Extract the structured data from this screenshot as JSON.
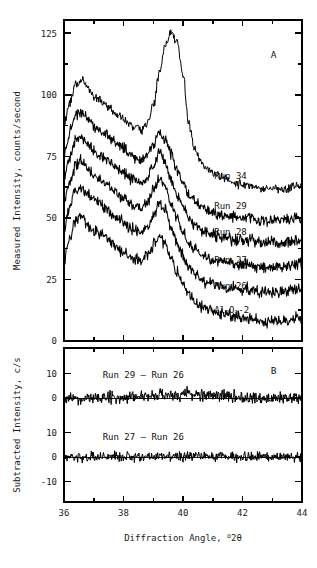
{
  "figure": {
    "xlabel_main": "Diffraction Angle, ",
    "xlabel_sup": "o",
    "xlabel_tail": "2θ",
    "panel_a_label": "A",
    "panel_b_label": "B",
    "ylabel_a": "Measured Intensity, counts/second",
    "ylabel_b": "Subtracted Intensity, c/s"
  },
  "chart_data": {
    "type": "line",
    "title": "",
    "xlabel": "Diffraction Angle, °2θ",
    "panels": [
      {
        "id": "A",
        "label": "A",
        "ylabel": "Measured Intensity, counts/second",
        "xlim": [
          36,
          44
        ],
        "ylim": [
          0,
          133
        ],
        "xticks": [
          36,
          38,
          40,
          42,
          44
        ],
        "xticklabels": [
          "36",
          "38",
          "40",
          "42",
          "44"
        ],
        "xminor": [
          37,
          39,
          41,
          43
        ],
        "yticks": [
          0,
          25,
          50,
          75,
          100,
          125
        ],
        "yticklabels": [
          "0",
          "25",
          "50",
          "75",
          "100",
          "125"
        ],
        "yminor": [
          12.5,
          37.5,
          62.5,
          87.5,
          112.5
        ],
        "grid": false,
        "legend_position": "inline-right",
        "series": [
          {
            "name": "Run 34",
            "label": "Run 34",
            "label_x": 41.05,
            "label_y": 66,
            "offset": 57,
            "noise": 1.5,
            "main_peak_height": 68,
            "shoulder_height": 49,
            "mid_peak_height": 0,
            "x": [
              36.0,
              36.2,
              36.4,
              36.6,
              36.8,
              37.0,
              37.2,
              37.4,
              37.6,
              37.8,
              38.0,
              38.2,
              38.4,
              38.6,
              38.8,
              39.0,
              39.2,
              39.4,
              39.6,
              39.8,
              40.0,
              40.2,
              40.4,
              40.6,
              40.8,
              41.0,
              41.4,
              41.8,
              42.2,
              42.6,
              43.0,
              43.4,
              43.8,
              44.0
            ],
            "y": [
              88,
              97,
              104,
              106,
              103,
              99,
              98,
              96,
              94,
              92,
              90,
              88,
              87,
              86,
              88,
              95,
              108,
              120,
              125,
              122,
              108,
              88,
              78,
              73,
              70,
              68,
              66,
              64,
              63,
              62,
              62,
              62,
              63,
              63
            ]
          },
          {
            "name": "Run 29",
            "label": "Run 29",
            "label_x": 41.05,
            "label_y": 53.5,
            "offset": 44,
            "noise": 2.0,
            "main_peak_height": 0,
            "shoulder_height": 0,
            "mid_peak_height": 0,
            "x": [
              36.0,
              36.2,
              36.4,
              36.6,
              36.8,
              37.0,
              37.2,
              37.4,
              37.6,
              37.8,
              38.0,
              38.2,
              38.4,
              38.6,
              38.8,
              39.0,
              39.2,
              39.4,
              39.6,
              39.8,
              40.0,
              40.2,
              40.4,
              40.6,
              40.8,
              41.0,
              41.4,
              41.8,
              42.2,
              42.6,
              43.0,
              43.4,
              43.8,
              44.0
            ],
            "y": [
              76,
              85,
              92,
              93,
              90,
              87,
              86,
              84,
              82,
              80,
              78,
              76,
              75,
              74,
              76,
              80,
              85,
              82,
              76,
              70,
              64,
              60,
              57,
              55,
              53,
              52,
              51,
              50,
              50,
              49,
              49,
              49,
              50,
              50
            ]
          },
          {
            "name": "Run 28",
            "label": "Run 28",
            "label_x": 41.05,
            "label_y": 43,
            "offset": 35,
            "noise": 2.0,
            "main_peak_height": 0,
            "shoulder_height": 0,
            "mid_peak_height": 0,
            "x": [
              36.0,
              36.2,
              36.4,
              36.6,
              36.8,
              37.0,
              37.2,
              37.4,
              37.6,
              37.8,
              38.0,
              38.2,
              38.4,
              38.6,
              38.8,
              39.0,
              39.2,
              39.4,
              39.6,
              39.8,
              40.0,
              40.2,
              40.4,
              40.6,
              40.8,
              41.0,
              41.4,
              41.8,
              42.2,
              42.6,
              43.0,
              43.4,
              43.8,
              44.0
            ],
            "y": [
              66,
              75,
              82,
              83,
              80,
              77,
              76,
              74,
              72,
              70,
              68,
              66,
              65,
              64,
              66,
              71,
              76,
              73,
              66,
              60,
              54,
              50,
              47,
              45,
              44,
              43,
              42,
              41,
              41,
              40,
              40,
              40,
              41,
              41
            ]
          },
          {
            "name": "Run 27",
            "label": "Run 27",
            "label_x": 41.05,
            "label_y": 31.5,
            "offset": 25,
            "noise": 2.0,
            "main_peak_height": 0,
            "shoulder_height": 0,
            "mid_peak_height": 0,
            "x": [
              36.0,
              36.2,
              36.4,
              36.6,
              36.8,
              37.0,
              37.2,
              37.4,
              37.6,
              37.8,
              38.0,
              38.2,
              38.4,
              38.6,
              38.8,
              39.0,
              39.2,
              39.4,
              39.6,
              39.8,
              40.0,
              40.2,
              40.4,
              40.6,
              40.8,
              41.0,
              41.4,
              41.8,
              42.2,
              42.6,
              43.0,
              43.4,
              43.8,
              44.0
            ],
            "y": [
              56,
              65,
              72,
              73,
              70,
              67,
              66,
              64,
              62,
              60,
              58,
              56,
              55,
              54,
              56,
              61,
              66,
              63,
              56,
              50,
              44,
              40,
              37,
              35,
              34,
              33,
              32,
              31,
              31,
              30,
              30,
              30,
              31,
              31
            ]
          },
          {
            "name": "Run 26",
            "label": "Run 26",
            "label_x": 41.05,
            "label_y": 21,
            "offset": 15,
            "noise": 2.0,
            "main_peak_height": 0,
            "shoulder_height": 0,
            "mid_peak_height": 0,
            "x": [
              36.0,
              36.2,
              36.4,
              36.6,
              36.8,
              37.0,
              37.2,
              37.4,
              37.6,
              37.8,
              38.0,
              38.2,
              38.4,
              38.6,
              38.8,
              39.0,
              39.2,
              39.4,
              39.6,
              39.8,
              40.0,
              40.2,
              40.4,
              40.6,
              40.8,
              41.0,
              41.4,
              41.8,
              42.2,
              42.6,
              43.0,
              43.4,
              43.8,
              44.0
            ],
            "y": [
              46,
              55,
              62,
              63,
              60,
              57,
              56,
              54,
              52,
              50,
              48,
              46,
              45,
              44,
              46,
              51,
              56,
              53,
              46,
              40,
              34,
              30,
              27,
              25,
              24,
              23,
              22,
              21,
              21,
              20,
              20,
              20,
              21,
              21
            ]
          },
          {
            "name": "Al2O3-2",
            "label": "Al2O3-2",
            "label_html": true,
            "label_x": 41.05,
            "label_y": 11.5,
            "offset": 5,
            "noise": 2.0,
            "main_peak_height": 0,
            "shoulder_height": 0,
            "mid_peak_height": 0,
            "x": [
              36.0,
              36.2,
              36.4,
              36.6,
              36.8,
              37.0,
              37.2,
              37.4,
              37.6,
              37.8,
              38.0,
              38.2,
              38.4,
              38.6,
              38.8,
              39.0,
              39.2,
              39.4,
              39.6,
              39.8,
              40.0,
              40.2,
              40.4,
              40.6,
              40.8,
              41.0,
              41.4,
              41.8,
              42.2,
              42.6,
              43.0,
              43.4,
              43.8,
              44.0
            ],
            "y": [
              33,
              42,
              49,
              50,
              47,
              45,
              44,
              42,
              40,
              38,
              36,
              34,
              33,
              33,
              35,
              39,
              43,
              40,
              34,
              28,
              23,
              19,
              16,
              14,
              13,
              12,
              11,
              10,
              9,
              8,
              8,
              8,
              9,
              9
            ]
          }
        ]
      },
      {
        "id": "B",
        "label": "B",
        "ylabel": "Subtracted Intensity, c/s",
        "xlim": [
          36,
          44
        ],
        "xticks": [
          36,
          38,
          40,
          42,
          44
        ],
        "xticklabels": [
          "36",
          "38",
          "40",
          "42",
          "44"
        ],
        "xminor": [
          37,
          39,
          41,
          43
        ],
        "grid": false,
        "subplots": [
          {
            "name": "Run 29 - Run 26",
            "label": "Run 29 – Run 26",
            "label_x": 37.3,
            "label_y": 8.2,
            "ylim": [
              -8,
              13
            ],
            "yticks": [
              10,
              0
            ],
            "yticklabels": [
              "10",
              "0"
            ],
            "baseline": 0,
            "noise": 2.2,
            "bump_center": 40.0,
            "bump_amp": 1.6
          },
          {
            "name": "Run 27 - Run 26",
            "label": "Run 27 – Run 26",
            "label_x": 37.3,
            "label_y": 7.0,
            "ylim": [
              -13,
              13
            ],
            "yticks": [
              10,
              0,
              -10
            ],
            "yticklabels": [
              "10",
              "0",
              "-10"
            ],
            "baseline": 0,
            "noise": 1.8,
            "bump_center": 40.0,
            "bump_amp": 0.5
          }
        ]
      }
    ]
  }
}
